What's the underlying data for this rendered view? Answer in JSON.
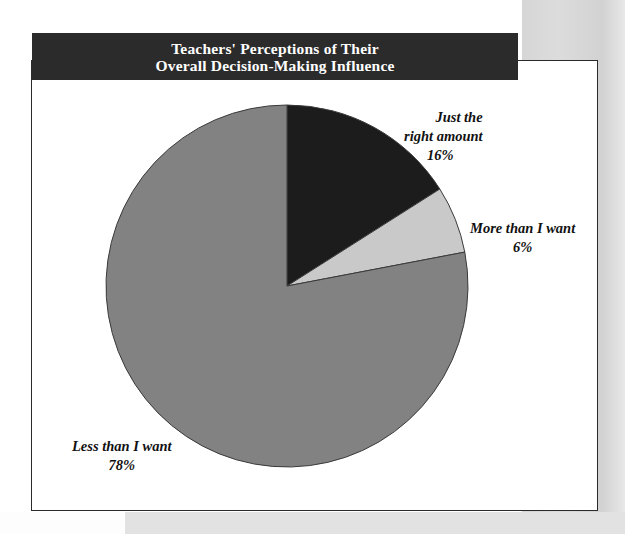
{
  "figure": {
    "title_line_1": "Teachers' Perceptions of Their",
    "title_line_2": "Overall Decision-Making Influence",
    "title_bar_color": "#2b2b2b",
    "title_text_color": "#ffffff",
    "frame_color": "#2a2a2a",
    "background_color": "#ffffff"
  },
  "labels": {
    "just_right": {
      "line_1": "Just the",
      "line_2": "right amount",
      "percent": "16%"
    },
    "more_than": {
      "line_1": "More than I want",
      "percent": "6%"
    },
    "less_than": {
      "line_1": "Less than I want",
      "percent": "78%"
    }
  },
  "chart_data": {
    "type": "pie",
    "title": "Teachers' Perceptions of Their Overall Decision-Making Influence",
    "categories": [
      "Just the right amount",
      "More than I want",
      "Less than I want"
    ],
    "values": [
      16,
      6,
      78
    ],
    "value_labels": [
      "16%",
      "6%",
      "78%"
    ],
    "unit": "percent",
    "total": 100,
    "colors": [
      "#1c1c1c",
      "#c9c9c9",
      "#828282"
    ],
    "slice_outline_color": "#3a3a3a",
    "start_angle_deg": 0,
    "direction": "clockwise",
    "legend": "none",
    "labels_position": "outside-callout",
    "grid": false,
    "center_px": [
      287,
      286
    ],
    "radius_px": 181
  }
}
